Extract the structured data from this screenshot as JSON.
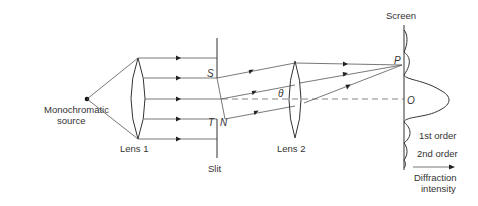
{
  "diagram": {
    "labels": {
      "source": [
        "Monochromatic",
        "source"
      ],
      "lens1": "Lens 1",
      "slit": "Slit",
      "lens2": "Lens 2",
      "screen": "Screen",
      "point_S": "S",
      "point_T": "T",
      "point_N": "N",
      "point_P": "P",
      "point_O": "O",
      "angle": "θ",
      "first_order": "1st order",
      "second_order": "2nd order",
      "intensity": [
        "Diffraction",
        "intensity"
      ]
    },
    "colors": {
      "line": "#555555",
      "text": "#333333",
      "background": "#ffffff"
    }
  }
}
